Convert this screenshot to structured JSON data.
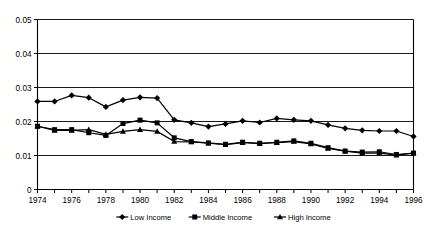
{
  "chart_data": {
    "type": "line",
    "title": "",
    "subtitle": "",
    "xlabel": "",
    "ylabel": "",
    "xlim": [
      1974,
      1996
    ],
    "ylim": [
      0,
      0.05
    ],
    "grid": true,
    "grid_axis": "y",
    "legend_position": "bottom",
    "x": [
      1974,
      1975,
      1976,
      1977,
      1978,
      1979,
      1980,
      1981,
      1982,
      1983,
      1984,
      1985,
      1986,
      1987,
      1988,
      1989,
      1990,
      1991,
      1992,
      1993,
      1994,
      1995,
      1996
    ],
    "ytick_labels": [
      "0",
      "0.01",
      "0.02",
      "0.03",
      "0.04",
      "0.05"
    ],
    "ytick_values": [
      0,
      0.01,
      0.02,
      0.03,
      0.04,
      0.05
    ],
    "xtick_labels": [
      "1974",
      "1976",
      "1978",
      "1980",
      "1982",
      "1984",
      "1986",
      "1988",
      "1990",
      "1992",
      "1994",
      "1996"
    ],
    "xtick_values": [
      1974,
      1976,
      1978,
      1980,
      1982,
      1984,
      1986,
      1988,
      1990,
      1992,
      1994,
      1996
    ],
    "series": [
      {
        "name": "Low Income",
        "marker": "diamond",
        "color": "#000000",
        "values": [
          0.0259,
          0.0259,
          0.0277,
          0.027,
          0.0243,
          0.0263,
          0.0271,
          0.0269,
          0.0205,
          0.0196,
          0.0185,
          0.0193,
          0.0202,
          0.0197,
          0.0209,
          0.0205,
          0.0202,
          0.019,
          0.018,
          0.0174,
          0.0172,
          0.0172,
          0.0156
        ]
      },
      {
        "name": "Middle Income",
        "marker": "square",
        "color": "#000000",
        "values": [
          0.0186,
          0.0176,
          0.0176,
          0.0167,
          0.0159,
          0.0194,
          0.0204,
          0.0196,
          0.0152,
          0.0141,
          0.0137,
          0.0133,
          0.0139,
          0.0136,
          0.0139,
          0.0143,
          0.0136,
          0.0123,
          0.0113,
          0.011,
          0.0111,
          0.0103,
          0.0107
        ]
      },
      {
        "name": "High Income",
        "marker": "triangle",
        "color": "#000000",
        "values": [
          0.0186,
          0.0174,
          0.0174,
          0.0176,
          0.0162,
          0.0171,
          0.0176,
          0.0171,
          0.0141,
          0.014,
          0.0136,
          0.0132,
          0.0138,
          0.0135,
          0.0138,
          0.0141,
          0.0134,
          0.0121,
          0.0113,
          0.0107,
          0.0107,
          0.0101,
          0.0107
        ]
      }
    ]
  },
  "legend": {
    "items": [
      {
        "label": "Low Income"
      },
      {
        "label": "Middle Income"
      },
      {
        "label": "High Income"
      }
    ]
  }
}
